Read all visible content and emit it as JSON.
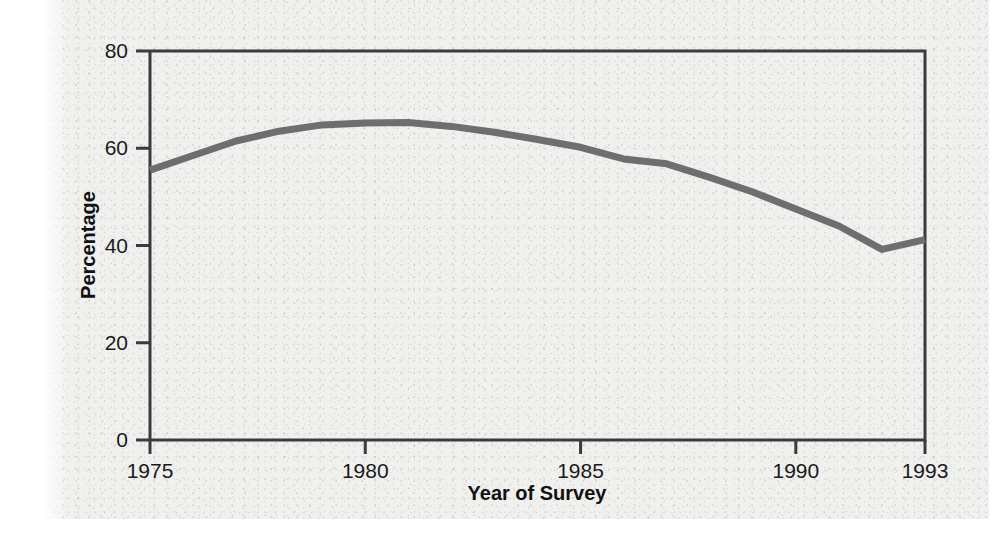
{
  "chart_data": {
    "type": "line",
    "title": "",
    "xlabel": "Year of Survey",
    "ylabel": "Percentage",
    "xlim": [
      1975,
      1993
    ],
    "ylim": [
      0,
      80
    ],
    "grid": false,
    "legend": false,
    "x_ticks": [
      "1975",
      "1980",
      "1985",
      "1990",
      "1993"
    ],
    "x_tick_values": [
      1975,
      1980,
      1985,
      1990,
      1993
    ],
    "y_ticks": [
      "0",
      "20",
      "40",
      "60",
      "80"
    ],
    "y_tick_values": [
      0,
      20,
      40,
      60,
      80
    ],
    "line_color": "#6e6e6e",
    "line_width": 7,
    "series": [
      {
        "name": "Percentage",
        "x": [
          1975,
          1976,
          1977,
          1978,
          1979,
          1980,
          1981,
          1982,
          1983,
          1984,
          1985,
          1986,
          1987,
          1988,
          1989,
          1990,
          1991,
          1992,
          1993
        ],
        "values": [
          55.5,
          58.5,
          61.5,
          63.5,
          64.8,
          65.2,
          65.3,
          64.5,
          63.3,
          61.8,
          60.2,
          57.8,
          56.8,
          54.0,
          51.0,
          47.5,
          44.0,
          39.2,
          41.2
        ]
      }
    ]
  },
  "axes": {
    "x_title": "Year of Survey",
    "y_title": "Percentage"
  }
}
